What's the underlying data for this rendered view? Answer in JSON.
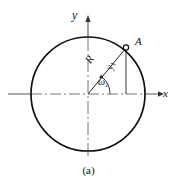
{
  "figure": {
    "caption": "(a)",
    "type": "circle-rotating-vector-diagram",
    "background_color": "#ffffff",
    "line_color": "#111111",
    "axis_color": "#555555"
  },
  "axes": {
    "y_label": "y",
    "x_label": "x",
    "origin": {
      "x": 88,
      "y": 94
    },
    "y_top": {
      "x": 88,
      "y": 16
    },
    "y_bottom": {
      "x": 88,
      "y": 157
    },
    "x_left": {
      "x": 8,
      "y": 94
    },
    "x_right": {
      "x": 162,
      "y": 94
    }
  },
  "circle": {
    "center_x": 88,
    "center_y": 94,
    "radius": 57,
    "stroke_width": 1.6
  },
  "point_a": {
    "label": "A",
    "x": 126,
    "y": 48,
    "marker": "open-circle"
  },
  "radius_line": {
    "label": "R",
    "from_x": 88,
    "from_y": 94,
    "to_x": 126,
    "to_y": 48
  },
  "projection_line": {
    "label_base": "y",
    "label_sub": "1",
    "from_x": 126,
    "from_y": 48,
    "to_x": 126,
    "to_y": 94
  },
  "angle": {
    "label_base": "ω",
    "label_sub": "1",
    "arc_radius": 22,
    "degrees": 50
  }
}
